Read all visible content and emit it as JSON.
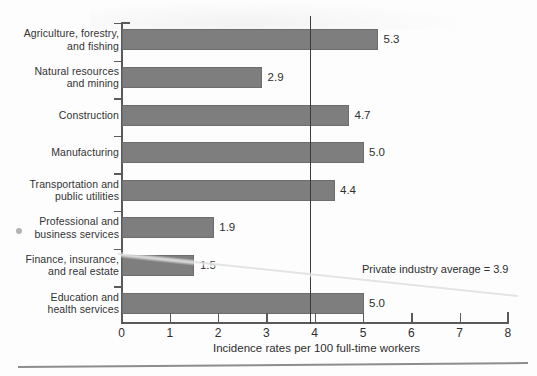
{
  "chart_data": {
    "type": "bar",
    "orientation": "horizontal",
    "title": "",
    "xlabel": "Incidence rates per 100 full-time workers",
    "ylabel": "",
    "xlim": [
      0,
      8
    ],
    "xticks": [
      "0",
      "1",
      "2",
      "3",
      "4",
      "5",
      "6",
      "7",
      "8"
    ],
    "grid": false,
    "legend": "none",
    "bar_color": "#7e7e7e",
    "categories": [
      "Agriculture, forestry, and fishing",
      "Natural resources and mining",
      "Construction",
      "Manufacturing",
      "Transportation and public utilities",
      "Professional and business services",
      "Finance, insurance, and real estate",
      "Education and health services"
    ],
    "values": [
      5.3,
      2.9,
      4.7,
      5.0,
      4.4,
      1.9,
      1.5,
      5.0
    ],
    "value_labels": [
      "5.3",
      "2.9",
      "4.7",
      "5.0",
      "4.4",
      "1.9",
      "1.5",
      "5.0"
    ],
    "annotations": [
      {
        "name": "private-industry-average",
        "text": "Private industry average = 3.9",
        "value": 3.9,
        "kind": "vertical-reference-line"
      }
    ]
  },
  "rows": [
    {
      "line1": "Agriculture, forestry,",
      "line2": "and fishing",
      "value_label": "5.3"
    },
    {
      "line1": "Natural resources",
      "line2": "and mining",
      "value_label": "2.9"
    },
    {
      "line1": "Construction",
      "line2": "",
      "value_label": "4.7"
    },
    {
      "line1": "Manufacturing",
      "line2": "",
      "value_label": "5.0"
    },
    {
      "line1": "Transportation and",
      "line2": "public utilities",
      "value_label": "4.4"
    },
    {
      "line1": "Professional and",
      "line2": "business services",
      "value_label": "1.9"
    },
    {
      "line1": "Finance, insurance,",
      "line2": "and real estate",
      "value_label": "1.5"
    },
    {
      "line1": "Education and",
      "line2": "health services",
      "value_label": "5.0"
    }
  ],
  "axis": {
    "title": "Incidence rates per 100 full-time workers",
    "ticks": [
      "0",
      "1",
      "2",
      "3",
      "4",
      "5",
      "6",
      "7",
      "8"
    ]
  },
  "annotation": {
    "average_text": "Private industry average = 3.9"
  }
}
